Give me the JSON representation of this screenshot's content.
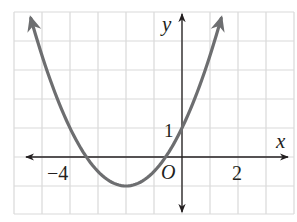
{
  "chart_data": {
    "type": "line",
    "title": "",
    "xlabel": "x",
    "ylabel": "y",
    "origin_label": "O",
    "xlim": [
      -6,
      4
    ],
    "ylim": [
      -2,
      5
    ],
    "grid": true,
    "grid_step": 1,
    "x_tick_labels": [
      {
        "value": -4,
        "label": "−4"
      },
      {
        "value": 2,
        "label": "2"
      }
    ],
    "y_tick_labels": [
      {
        "value": 1,
        "label": "1"
      }
    ],
    "series": [
      {
        "name": "parabola",
        "equation": "y = 0.5x^2 + 2x + 1",
        "vertex": [
          -2,
          -1
        ],
        "y_intercept": 1,
        "x_intercepts": [
          -3.41,
          -0.59
        ],
        "x": [
          -5.4,
          -5,
          -4.5,
          -4,
          -3.5,
          -3,
          -2.5,
          -2,
          -1.5,
          -1,
          -0.5,
          0,
          0.5,
          1,
          1.4
        ],
        "y": [
          4.78,
          3.5,
          2.125,
          1,
          0.125,
          -0.5,
          -0.875,
          -1,
          -0.875,
          -0.5,
          0.125,
          1,
          2.125,
          3.5,
          4.78
        ],
        "color": "#6d6e70",
        "arrows_both_ends": true
      }
    ],
    "colors": {
      "grid": "#d9d9d9",
      "axis": "#231f20",
      "curve": "#6d6e70"
    }
  }
}
